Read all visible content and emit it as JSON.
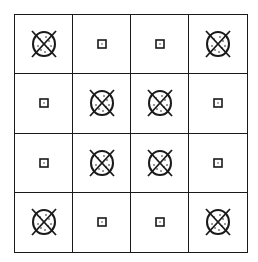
{
  "diagram": {
    "rows": 4,
    "cols": 4,
    "line_color": "#1a1a1a",
    "background": "#ffffff",
    "legend": {
      "X": "crossed-dotted-circle-icon",
      "S": "small-square-icon"
    },
    "cells": [
      [
        "X",
        "S",
        "S",
        "X"
      ],
      [
        "S",
        "X",
        "X",
        "S"
      ],
      [
        "S",
        "X",
        "X",
        "S"
      ],
      [
        "X",
        "S",
        "S",
        "X"
      ]
    ]
  }
}
